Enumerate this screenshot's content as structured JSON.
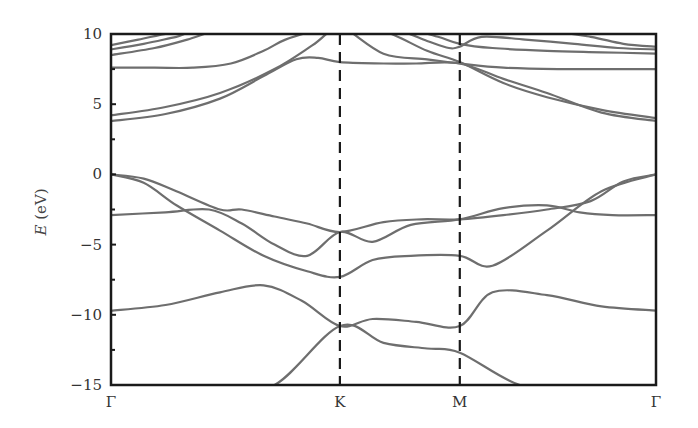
{
  "chart_data": {
    "type": "line",
    "title": "",
    "xlabel": "",
    "ylabel": "E (eV)",
    "ylabel_italic_part": "E",
    "ylabel_unit_part": "(eV)",
    "ylim": [
      -15,
      10
    ],
    "yticks": [
      10,
      5,
      0,
      -5,
      -10,
      -15
    ],
    "ytick_labels": [
      "10",
      "5",
      "0",
      "−5",
      "−10",
      "−15"
    ],
    "xlim": [
      0,
      1
    ],
    "high_symmetry_points": [
      {
        "label": "Γ",
        "x": 0.0
      },
      {
        "label": "K",
        "x": 0.42
      },
      {
        "label": "M",
        "x": 0.64
      },
      {
        "label": "Γ",
        "x": 1.0
      }
    ],
    "vertical_dashed_lines_at": [
      0.42,
      0.64
    ],
    "grid": false,
    "legend": null,
    "line_color": "#6e6e6e",
    "frame_color": "#1a1a1a",
    "series": [
      {
        "name": "band-v1",
        "x": [
          0,
          0.05,
          0.12,
          0.2,
          0.3,
          0.42,
          0.5,
          0.58,
          0.64,
          0.75,
          0.85,
          0.93,
          1.0
        ],
        "values": [
          -15.8,
          -15.6,
          -15.4,
          -15.2,
          -15.0,
          -10.8,
          -12.0,
          -12.4,
          -12.7,
          -15.0,
          -15.2,
          -15.5,
          -15.8
        ]
      },
      {
        "name": "band-v2",
        "x": [
          0,
          0.1,
          0.2,
          0.28,
          0.35,
          0.42,
          0.48,
          0.56,
          0.64,
          0.7,
          0.8,
          0.9,
          1.0
        ],
        "values": [
          -9.7,
          -9.3,
          -8.4,
          -7.9,
          -9.0,
          -10.8,
          -10.3,
          -10.5,
          -10.8,
          -8.4,
          -8.6,
          -9.4,
          -9.7
        ]
      },
      {
        "name": "band-v3",
        "x": [
          0,
          0.06,
          0.12,
          0.2,
          0.28,
          0.36,
          0.42,
          0.48,
          0.55,
          0.64,
          0.7,
          0.8,
          0.9,
          1.0
        ],
        "values": [
          0.0,
          -0.6,
          -2.2,
          -4.0,
          -5.8,
          -6.9,
          -7.3,
          -6.1,
          -5.8,
          -5.8,
          -6.5,
          -4.0,
          -1.2,
          0.0
        ]
      },
      {
        "name": "band-v4",
        "x": [
          0,
          0.06,
          0.12,
          0.2,
          0.24,
          0.3,
          0.36,
          0.42,
          0.5,
          0.57,
          0.64,
          0.72,
          0.8,
          0.88,
          0.94,
          1.0
        ],
        "values": [
          0.0,
          -0.3,
          -1.2,
          -2.5,
          -2.5,
          -3.0,
          -3.5,
          -4.1,
          -3.4,
          -3.2,
          -3.2,
          -2.9,
          -2.5,
          -1.9,
          -0.5,
          0.0
        ]
      },
      {
        "name": "band-v5",
        "x": [
          0,
          0.1,
          0.18,
          0.24,
          0.3,
          0.36,
          0.42,
          0.48,
          0.55,
          0.64,
          0.72,
          0.8,
          0.86,
          0.92,
          1.0
        ],
        "values": [
          -2.9,
          -2.7,
          -2.5,
          -3.5,
          -5.0,
          -5.8,
          -4.1,
          -4.8,
          -3.6,
          -3.2,
          -2.4,
          -2.2,
          -2.7,
          -2.9,
          -2.9
        ]
      },
      {
        "name": "band-c1",
        "x": [
          0,
          0.1,
          0.2,
          0.3,
          0.37,
          0.42,
          0.5,
          0.58,
          0.64,
          0.72,
          0.8,
          0.9,
          1.0
        ],
        "values": [
          4.2,
          4.8,
          5.8,
          7.5,
          9.2,
          10.5,
          10.2,
          8.8,
          8.0,
          6.5,
          5.5,
          4.6,
          4.0
        ]
      },
      {
        "name": "band-c2",
        "x": [
          0,
          0.1,
          0.2,
          0.28,
          0.34,
          0.38,
          0.42,
          0.5,
          0.56,
          0.64,
          0.72,
          0.8,
          0.9,
          1.0
        ],
        "values": [
          3.8,
          4.3,
          5.4,
          7.0,
          8.2,
          8.3,
          8.0,
          7.9,
          7.9,
          7.9,
          6.8,
          5.8,
          4.4,
          3.8
        ]
      },
      {
        "name": "band-c3",
        "x": [
          0,
          0.08,
          0.15,
          0.22,
          0.28,
          0.32,
          0.38,
          0.42,
          0.5,
          0.58,
          0.64,
          0.72,
          0.82,
          0.9,
          1.0
        ],
        "values": [
          7.6,
          7.6,
          7.6,
          7.9,
          8.8,
          9.6,
          10.3,
          10.6,
          8.6,
          8.2,
          7.9,
          7.6,
          7.5,
          7.5,
          7.5
        ]
      },
      {
        "name": "band-c4",
        "x": [
          0,
          0.08,
          0.14,
          0.2,
          0.28,
          0.42,
          0.55,
          0.6,
          0.64,
          0.7,
          0.8,
          0.9,
          1.0
        ],
        "values": [
          8.5,
          9.0,
          9.6,
          10.3,
          10.5,
          10.5,
          10.2,
          9.8,
          9.3,
          9.0,
          8.8,
          8.7,
          8.6
        ]
      },
      {
        "name": "band-c5",
        "x": [
          0,
          0.06,
          0.12,
          0.18,
          0.42,
          0.52,
          0.58,
          0.62,
          0.64,
          0.68,
          0.76,
          0.85,
          0.93,
          1.0
        ],
        "values": [
          8.9,
          9.3,
          9.8,
          10.3,
          10.5,
          10.3,
          9.5,
          9.0,
          9.1,
          9.8,
          9.6,
          9.3,
          9.0,
          8.9
        ]
      },
      {
        "name": "band-c6",
        "x": [
          0,
          0.05,
          0.1,
          0.16,
          0.42,
          0.6,
          0.68,
          0.8,
          0.88,
          0.94,
          1.0
        ],
        "values": [
          9.2,
          9.6,
          10.0,
          10.4,
          10.5,
          10.4,
          10.3,
          10.2,
          9.8,
          9.3,
          9.1
        ]
      }
    ]
  }
}
